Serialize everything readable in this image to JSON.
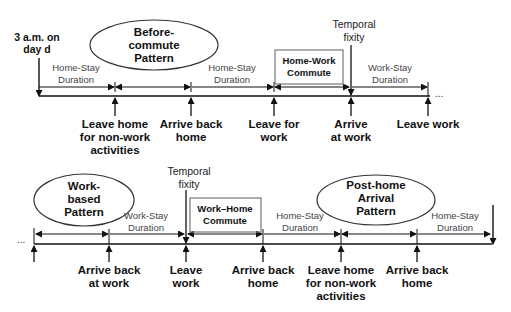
{
  "diagram": {
    "top_timeline": {
      "start_label": [
        "3 a.m. on",
        "day d"
      ],
      "pattern_label": [
        "Before-",
        "commute",
        "Pattern"
      ],
      "commute_box": [
        "Home-Work",
        "Commute"
      ],
      "temporal_fixity": [
        "Temporal",
        "fixity"
      ],
      "durations": [
        {
          "lines": [
            "Home-Stay",
            "Duration"
          ]
        },
        {
          "lines": [
            "Home-Stay",
            "Duration"
          ]
        },
        {
          "lines": [
            "Work-Stay",
            "Duration"
          ]
        }
      ],
      "events": [
        {
          "lines": [
            "Leave home",
            "for non-work",
            "activities"
          ]
        },
        {
          "lines": [
            "Arrive back",
            "home"
          ]
        },
        {
          "lines": [
            "Leave for",
            "work"
          ]
        },
        {
          "lines": [
            "Arrive",
            "at work"
          ]
        },
        {
          "lines": [
            "Leave work"
          ]
        }
      ],
      "continuation": "..."
    },
    "bottom_timeline": {
      "leading": "...",
      "pattern_left": [
        "Work-",
        "based",
        "Pattern"
      ],
      "pattern_right": [
        "Post-home",
        "Arrival",
        "Pattern"
      ],
      "commute_box": [
        "Work–Home",
        "Commute"
      ],
      "temporal_fixity": [
        "Temporal",
        "fixity"
      ],
      "durations": [
        {
          "lines": [
            "Work-Stay",
            "Duration"
          ]
        },
        {
          "lines": [
            "Home-Stay",
            "Duration"
          ]
        },
        {
          "lines": [
            "Home-Stay",
            "Duration"
          ]
        }
      ],
      "events": [
        {
          "lines": [
            "Arrive back",
            "at work"
          ]
        },
        {
          "lines": [
            "Leave",
            "work"
          ]
        },
        {
          "lines": [
            "Arrive back",
            "home"
          ]
        },
        {
          "lines": [
            "Leave home",
            "for non-work",
            "activities"
          ]
        },
        {
          "lines": [
            "Arrive back",
            "home"
          ]
        }
      ]
    },
    "colors": {
      "line": "#111111",
      "box_border": "#666666",
      "text": "#111111",
      "duration_text": "#444444"
    }
  }
}
